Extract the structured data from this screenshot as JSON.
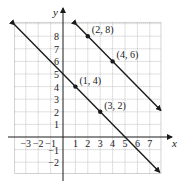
{
  "chart_data": {
    "type": "line",
    "title": "",
    "xlabel": "x",
    "ylabel": "y",
    "xlim": [
      -3.9,
      7.9
    ],
    "ylim": [
      -2.9,
      9.1
    ],
    "grid": true,
    "x_ticks": [
      -3,
      -2,
      -1,
      1,
      2,
      3,
      4,
      5,
      6,
      7
    ],
    "y_ticks": [
      -2,
      -1,
      1,
      2,
      3,
      4,
      5,
      6,
      7,
      8
    ],
    "x_tick_labels": [
      "−3",
      "−2",
      "−1",
      "1",
      "2",
      "3",
      "4",
      "5",
      "6",
      "7"
    ],
    "y_tick_labels": [
      "−2",
      "−1",
      "1",
      "2",
      "3",
      "4",
      "5",
      "6",
      "7",
      "8"
    ],
    "series": [
      {
        "name": "line through (1, 4) and (3, 2)",
        "equation": "y = -x + 5",
        "slope": -1,
        "intercept": 5,
        "x": [
          -3.9,
          7.8
        ],
        "y": [
          8.9,
          -2.8
        ],
        "arrows": "both",
        "points": [
          {
            "x": 1,
            "y": 4,
            "label": "(1, 4)"
          },
          {
            "x": 3,
            "y": 2,
            "label": "(3, 2)"
          }
        ]
      },
      {
        "name": "line through (2, 8) and (4, 6)",
        "equation": "y = -x + 10",
        "slope": -1,
        "intercept": 10,
        "x": [
          1.1,
          7.9
        ],
        "y": [
          8.9,
          2.1
        ],
        "arrows": "both",
        "points": [
          {
            "x": 2,
            "y": 8,
            "label": "(2, 8)"
          },
          {
            "x": 4,
            "y": 6,
            "label": "(4, 6)"
          }
        ]
      }
    ]
  },
  "colors": {
    "line": "#1a1a1a",
    "grid": "#9a9a9a",
    "axis": "#1a1a1a",
    "background": "#ffffff"
  }
}
